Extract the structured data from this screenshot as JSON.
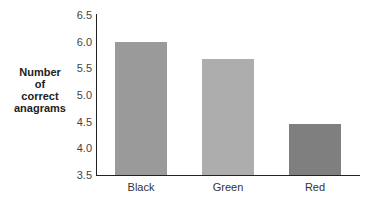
{
  "chart_data": {
    "type": "bar",
    "title": "",
    "xlabel": "",
    "ylabel": "Number of correct anagrams",
    "ylabel_lines": [
      "Number",
      "of",
      "correct",
      "anagrams"
    ],
    "categories": [
      "Black",
      "Green",
      "Red"
    ],
    "values": [
      6.0,
      5.67,
      4.45
    ],
    "colors": [
      "#9a9a9a",
      "#adadad",
      "#7f7f7f"
    ],
    "ylim": [
      3.5,
      6.5
    ],
    "yticks": [
      "6.5",
      "6.0",
      "5.5",
      "5.0",
      "4.5",
      "4.0",
      "3.5"
    ],
    "grid": false,
    "legend": null
  }
}
